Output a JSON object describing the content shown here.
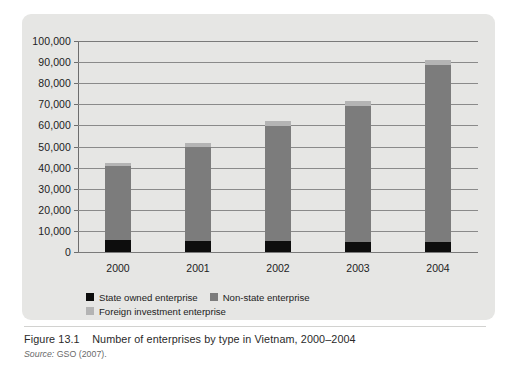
{
  "figure": {
    "number": "Figure 13.1",
    "title": "Number of enterprises by type in Vietnam, 2000–2004",
    "source_label": "Source:",
    "source_text": "GSO (2007)."
  },
  "legend": {
    "entries": [
      {
        "label": "State owned enterprise",
        "color": "#0d0d0d",
        "key": "state"
      },
      {
        "label": "Non-state enterprise",
        "color": "#7c7c7c",
        "key": "nonstate"
      },
      {
        "label": "Foreign investment enterprise",
        "color": "#b4b4b4",
        "key": "foreign"
      }
    ]
  },
  "chart_data": {
    "type": "bar",
    "stacked": true,
    "title": "Number of enterprises by type in Vietnam, 2000–2004",
    "xlabel": "",
    "ylabel": "",
    "grid": true,
    "legend_position": "bottom-left",
    "categories": [
      "2000",
      "2001",
      "2002",
      "2003",
      "2004"
    ],
    "ylim": [
      0,
      100000
    ],
    "ytick_values": [
      0,
      10000,
      20000,
      30000,
      40000,
      50000,
      60000,
      70000,
      80000,
      90000,
      100000
    ],
    "ytick_labels": [
      "0",
      "10,000",
      "20,000",
      "30,000",
      "40,000",
      "50,000",
      "60,000",
      "70,000",
      "80,000",
      "90,000",
      "100,000"
    ],
    "series": [
      {
        "name": "State owned enterprise",
        "color": "#0d0d0d",
        "values": [
          5800,
          5400,
          5400,
          4800,
          4600
        ]
      },
      {
        "name": "Non-state enterprise",
        "color": "#7c7c7c",
        "values": [
          34800,
          44300,
          54500,
          64500,
          84000
        ]
      },
      {
        "name": "Foreign investment enterprise",
        "color": "#b4b4b4",
        "values": [
          1500,
          2000,
          2300,
          2400,
          2600
        ]
      }
    ],
    "totals": [
      42100,
      51700,
      62200,
      71700,
      91200
    ]
  }
}
